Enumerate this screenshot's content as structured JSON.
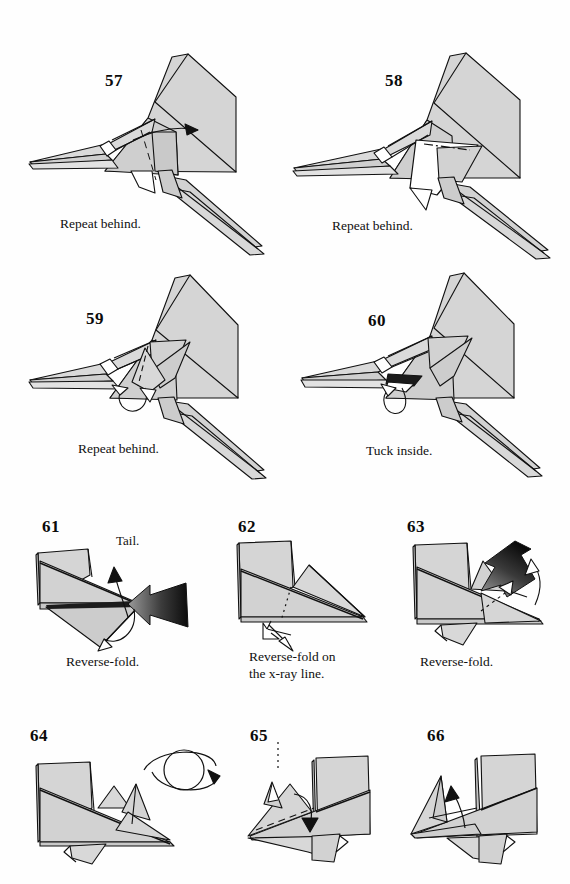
{
  "page": {
    "background_color": "#fefefe",
    "paper_shade_light": "#d5d5d5",
    "paper_shade_mid": "#c4c4c4",
    "line_color": "#111111",
    "arrow_dark": "#121212",
    "arrow_gray": "#8a8a8a"
  },
  "steps": [
    {
      "number": "57",
      "caption": "Repeat behind.",
      "annotation": "",
      "symbols": [
        "fold-arrow-right",
        "valley-fold-dashed-line"
      ]
    },
    {
      "number": "58",
      "caption": "Repeat behind.",
      "annotation": "",
      "symbols": [
        "x-ray-dash-dot-line",
        "fold-arrow-right"
      ]
    },
    {
      "number": "59",
      "caption": "Repeat behind.",
      "annotation": "",
      "symbols": [
        "tuck-loop-arrow",
        "valley-fold-dashed-line"
      ]
    },
    {
      "number": "60",
      "caption": "Tuck inside.",
      "annotation": "",
      "symbols": [
        "tuck-loop-arrow"
      ]
    },
    {
      "number": "61",
      "caption": "Reverse-fold.",
      "annotation": "Tail.",
      "symbols": [
        "gradient-push-arrow",
        "pointer-arrow-up",
        "loop-arrow-under"
      ]
    },
    {
      "number": "62",
      "caption": "Reverse-fold on\nthe x-ray line.",
      "annotation": "",
      "symbols": [
        "x-ray-dotted-line",
        "outline-arrow-down-left"
      ]
    },
    {
      "number": "63",
      "caption": "Reverse-fold.",
      "annotation": "",
      "symbols": [
        "gradient-push-arrow",
        "outline-arrow-up",
        "outline-arrow-left"
      ]
    },
    {
      "number": "64",
      "caption": "",
      "annotation": "",
      "symbols": [
        "turn-over-symbol"
      ]
    },
    {
      "number": "65",
      "caption": "",
      "annotation": "",
      "symbols": [
        "fold-arrow-down",
        "valley-fold-dashed-line",
        "x-ray-dotted-line"
      ]
    },
    {
      "number": "66",
      "caption": "",
      "annotation": "",
      "symbols": [
        "fold-arrow-up"
      ]
    }
  ]
}
